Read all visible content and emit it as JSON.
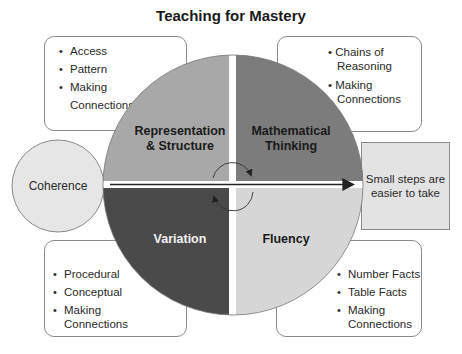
{
  "title": "Teaching for Mastery",
  "colors": {
    "representation": "#a8a8a8",
    "thinking": "#7c7c7c",
    "variation": "#4a4a4a",
    "fluency": "#d6d6d6",
    "coherence": "#e6e6e6",
    "small_steps": "#e3e3e3",
    "outline": "#8a8a8a"
  },
  "quadrants": {
    "representation": {
      "line1": "Representation",
      "line2": "& Structure"
    },
    "thinking": {
      "line1": "Mathematical",
      "line2": "Thinking"
    },
    "variation": {
      "line1": "Variation"
    },
    "fluency": {
      "line1": "Fluency"
    }
  },
  "coherence": {
    "label": "Coherence"
  },
  "small_steps": {
    "line1": "Small steps are",
    "line2": "easier to take"
  },
  "boxes": {
    "top_left": {
      "items": [
        "Access",
        "Pattern",
        "Making",
        "Connections"
      ]
    },
    "top_right": {
      "items": [
        "Chains of",
        "Reasoning",
        "Making",
        "Connections"
      ]
    },
    "bottom_left": {
      "items": [
        "Procedural",
        "Conceptual",
        "Making",
        "Connections"
      ]
    },
    "bottom_right": {
      "items": [
        "Number Facts",
        "Table Facts",
        "Making",
        "Connections"
      ]
    }
  }
}
